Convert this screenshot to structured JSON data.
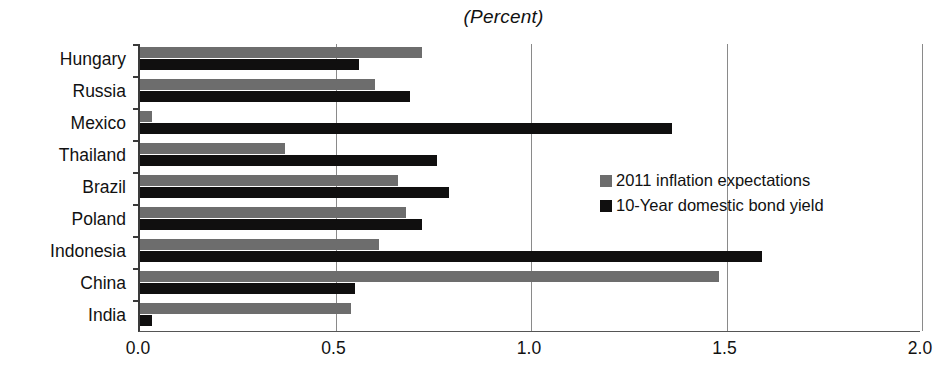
{
  "chart_data": {
    "type": "bar",
    "orientation": "horizontal",
    "title": "(Percent)",
    "xlabel": "",
    "ylabel": "",
    "xlim": [
      0.0,
      2.0
    ],
    "xticks": [
      "0.0",
      "0.5",
      "1.0",
      "1.5",
      "2.0"
    ],
    "xtick_values": [
      0.0,
      0.5,
      1.0,
      1.5,
      2.0
    ],
    "grid": true,
    "grid_axis": "x",
    "legend_position": "center-right",
    "categories": [
      "Hungary",
      "Russia",
      "Mexico",
      "Thailand",
      "Brazil",
      "Poland",
      "Indonesia",
      "China",
      "India"
    ],
    "series": [
      {
        "name": "2011 inflation expectations",
        "color": "#6d6d6d",
        "values": [
          0.72,
          0.6,
          0.03,
          0.37,
          0.66,
          0.68,
          0.61,
          1.48,
          0.54
        ]
      },
      {
        "name": "10-Year domestic bond yield",
        "color": "#100f0f",
        "values": [
          0.56,
          0.69,
          1.36,
          0.76,
          0.79,
          0.72,
          1.59,
          0.55,
          0.03
        ]
      }
    ]
  },
  "legend": {
    "entries": [
      {
        "label": "2011 inflation expectations",
        "color": "#6d6d6d"
      },
      {
        "label": "10-Year domestic bond yield",
        "color": "#100f0f"
      }
    ]
  }
}
